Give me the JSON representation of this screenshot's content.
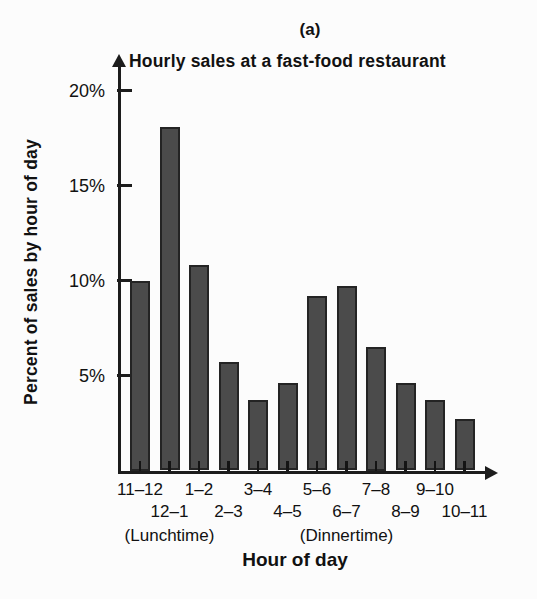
{
  "figure_label": "(a)",
  "chart_data": {
    "type": "bar",
    "title": "Hourly sales at a fast-food restaurant",
    "xlabel": "Hour of day",
    "ylabel": "Percent of sales by hour of day",
    "categories": [
      "11–12",
      "12–1",
      "1–2",
      "2–3",
      "3–4",
      "4–5",
      "5–6",
      "6–7",
      "7–8",
      "8–9",
      "9–10",
      "10–11"
    ],
    "values": [
      10.0,
      18.1,
      10.8,
      5.7,
      3.7,
      4.6,
      9.2,
      9.7,
      6.5,
      4.6,
      3.7,
      2.7
    ],
    "y_ticks": [
      {
        "label": "20%",
        "value": 20
      },
      {
        "label": "15%",
        "value": 15
      },
      {
        "label": "10%",
        "value": 10
      },
      {
        "label": "5%",
        "value": 5
      }
    ],
    "ylim": [
      0,
      21
    ],
    "grid": false,
    "legend": null,
    "annotations": [
      {
        "text": "(Lunchtime)",
        "category_index": 1
      },
      {
        "text": "(Dinnertime)",
        "category_index": 7
      }
    ],
    "bar_color": "#4b4b4b",
    "bar_border_color": "#242424",
    "axis_color": "#1c1c1c",
    "background_color": "#fcfcfc"
  }
}
